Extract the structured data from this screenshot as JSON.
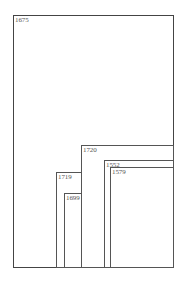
{
  "diagram": {
    "type": "nested-rectangles",
    "stroke_color": "#555555",
    "background": "#ffffff",
    "shared_right_edge_px": 173,
    "shared_bottom_edge_px": 267,
    "rects": [
      {
        "id": "r1675",
        "label": "1675",
        "left": 13,
        "top": 15,
        "right": 173,
        "bottom": 267
      },
      {
        "id": "r1720",
        "label": "1720",
        "left": 81,
        "top": 145,
        "right": 173,
        "bottom": 267
      },
      {
        "id": "r1719",
        "label": "1719",
        "left": 56,
        "top": 172,
        "right": 81,
        "bottom": 267
      },
      {
        "id": "r1699",
        "label": "1699",
        "left": 64,
        "top": 193,
        "right": 81,
        "bottom": 267
      },
      {
        "id": "r1552",
        "label": "1552",
        "left": 104,
        "top": 160,
        "right": 173,
        "bottom": 267
      },
      {
        "id": "r1579",
        "label": "1579",
        "left": 110,
        "top": 167,
        "right": 173,
        "bottom": 267
      }
    ]
  }
}
